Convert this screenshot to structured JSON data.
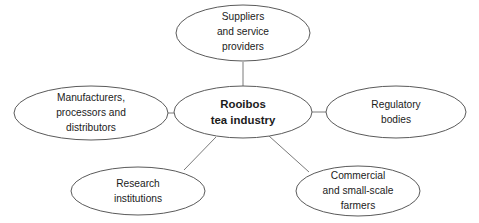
{
  "diagram": {
    "type": "hub-and-spoke-ellipse-diagram",
    "background_color": "#ffffff",
    "ellipse_stroke_color": "#5a5a5a",
    "connector_color": "#7a7a7a",
    "text_color": "#1b1b1b",
    "center": {
      "id": "rooibos-tea-industry",
      "lines": [
        "Rooibos",
        "tea industry"
      ],
      "bold": true,
      "cx": 243,
      "cy": 112,
      "rx": 69,
      "ry": 26
    },
    "nodes": [
      {
        "id": "suppliers-and-service-providers",
        "lines": [
          "Suppliers",
          "and service",
          "providers"
        ],
        "cx": 243,
        "cy": 33,
        "rx": 67,
        "ry": 28
      },
      {
        "id": "manufacturers-processors-and-distributors",
        "lines": [
          "Manufacturers,",
          "processors and",
          "distributors"
        ],
        "cx": 91,
        "cy": 113,
        "rx": 77,
        "ry": 27
      },
      {
        "id": "regulatory-bodies",
        "lines": [
          "Regulatory",
          "bodies"
        ],
        "cx": 396,
        "cy": 112,
        "rx": 70,
        "ry": 26
      },
      {
        "id": "research-institutions",
        "lines": [
          "Research",
          "institutions"
        ],
        "cx": 138,
        "cy": 191,
        "rx": 67,
        "ry": 24
      },
      {
        "id": "commercial-and-small-scale-farmers",
        "lines": [
          "Commercial",
          "and small-scale",
          "farmers"
        ],
        "cx": 358,
        "cy": 191,
        "rx": 62,
        "ry": 25
      }
    ],
    "connectors": [
      {
        "id": "center-to-suppliers",
        "x1": 243,
        "y1": 62,
        "x2": 243,
        "y2": 86
      },
      {
        "id": "center-to-manufacturers",
        "x1": 168,
        "y1": 113,
        "x2": 175,
        "y2": 113
      },
      {
        "id": "center-to-regulatory",
        "x1": 312,
        "y1": 112,
        "x2": 326,
        "y2": 112
      },
      {
        "id": "center-to-research",
        "x1": 216,
        "y1": 137,
        "x2": 184,
        "y2": 170
      },
      {
        "id": "center-to-farmers",
        "x1": 269,
        "y1": 136,
        "x2": 309,
        "y2": 172
      }
    ]
  }
}
